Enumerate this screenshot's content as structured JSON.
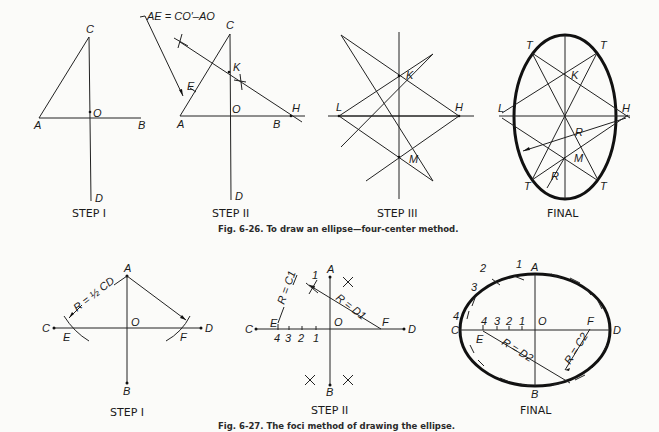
{
  "figure_626": {
    "caption": "Fig. 6-26. To draw an ellipse—four-center method.",
    "panels": [
      {
        "step_label": "STEP I",
        "points": {
          "A": "A",
          "B": "B",
          "C": "C",
          "D": "D",
          "O": "O"
        }
      },
      {
        "step_label": "STEP II",
        "annotation": "AE = CO′–AO",
        "points": {
          "A": "A",
          "B": "B",
          "C": "C",
          "D": "D",
          "O": "O",
          "E": "E",
          "K": "K",
          "H": "H"
        }
      },
      {
        "step_label": "STEP III",
        "points": {
          "K": "K",
          "L": "L",
          "H": "H",
          "M": "M"
        }
      },
      {
        "step_label": "FINAL",
        "points": {
          "T1": "T",
          "T2": "T",
          "T3": "T",
          "T4": "T",
          "K": "K",
          "L": "L",
          "H": "H",
          "M": "M",
          "R1": "R",
          "R2": "R"
        }
      }
    ]
  },
  "figure_627": {
    "caption": "Fig. 6-27. The foci method of drawing the ellipse.",
    "panels": [
      {
        "step_label": "STEP I",
        "annotation": "R = ½ CD",
        "points": {
          "A": "A",
          "B": "B",
          "C": "C",
          "D": "D",
          "O": "O",
          "E": "E",
          "F": "F"
        }
      },
      {
        "step_label": "STEP II",
        "annotation_1": "R = C1",
        "annotation_2": "R = D1",
        "points": {
          "A": "A",
          "B": "B",
          "C": "C",
          "D": "D",
          "O": "O",
          "E": "E",
          "F": "F",
          "n1": "1",
          "n2": "2",
          "n3": "3",
          "n4": "4",
          "top1": "1"
        }
      },
      {
        "step_label": "FINAL",
        "annotation_1": "R = D2",
        "annotation_2": "R = C2",
        "points": {
          "A": "A",
          "B": "B",
          "C": "C",
          "D": "D",
          "O": "O",
          "E": "E",
          "F": "F",
          "n1": "1",
          "n2": "2",
          "n3": "3",
          "n4": "4",
          "e1": "1",
          "e2": "2",
          "e3": "3",
          "e4": "4"
        }
      }
    ]
  }
}
